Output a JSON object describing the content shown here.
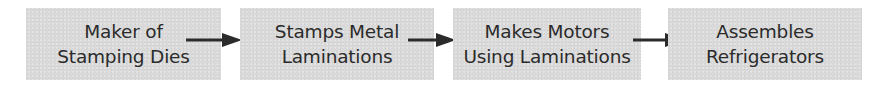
{
  "diagram": {
    "type": "flow-chain",
    "nodes": [
      {
        "id": "n1",
        "line1": "Maker of",
        "line2": "Stamping Dies"
      },
      {
        "id": "n2",
        "line1": "Stamps Metal",
        "line2": "Laminations"
      },
      {
        "id": "n3",
        "line1": "Makes Motors",
        "line2": "Using Laminations"
      },
      {
        "id": "n4",
        "line1": "Assembles",
        "line2": "Refrigerators"
      }
    ],
    "edges": [
      {
        "from": "n1",
        "to": "n2"
      },
      {
        "from": "n2",
        "to": "n3"
      },
      {
        "from": "n3",
        "to": "n4"
      }
    ],
    "colors": {
      "box_fill": "#d9d9d9",
      "text": "#2b2b2b",
      "arrow": "#2b2b2b",
      "background": "#ffffff"
    }
  }
}
